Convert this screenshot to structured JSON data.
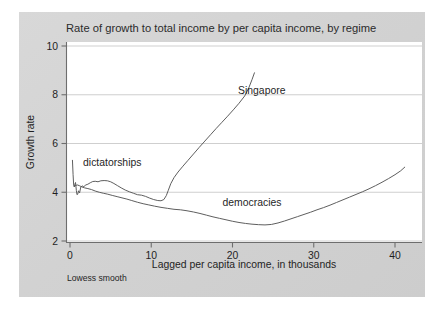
{
  "figure": {
    "panel_bg": "#d4d4d4",
    "plot_bg": "#ffffff",
    "frame_color": "#6e6e6e",
    "grid_color": "#c9c9c9",
    "line_color": "#555555"
  },
  "chart_data": {
    "type": "line",
    "title": "Rate of growth to total income by per capita income, by regime",
    "xlabel": "Lagged per capita income, in thousands",
    "ylabel": "Growth rate",
    "note": "Lowess smooth",
    "grid": "horizontal",
    "legend_position": "inline-annotations",
    "xlim": [
      -0.6,
      43.5
    ],
    "ylim": [
      1.78,
      10.25
    ],
    "xticks": [
      0,
      10,
      20,
      30,
      40
    ],
    "yticks": [
      2,
      4,
      6,
      8,
      10
    ],
    "xtick_labels": [
      "0",
      "10",
      "20",
      "30",
      "40"
    ],
    "ytick_labels": [
      "2",
      "4",
      "6",
      "8",
      "10"
    ],
    "annotations": [
      {
        "text": "Singapore",
        "x": 23.6,
        "y": 8.05
      },
      {
        "text": "dictatorships",
        "x": 5.2,
        "y": 5.08
      },
      {
        "text": "democracies",
        "x": 22.4,
        "y": 3.45
      }
    ],
    "series": [
      {
        "name": "dictatorships",
        "label": "dictatorships",
        "annotation_also": "Singapore",
        "points": [
          [
            0.3,
            5.31
          ],
          [
            0.38,
            4.72
          ],
          [
            0.45,
            4.3
          ],
          [
            0.52,
            4.22
          ],
          [
            0.6,
            4.33
          ],
          [
            0.68,
            4.4
          ],
          [
            0.78,
            4.08
          ],
          [
            0.86,
            3.9
          ],
          [
            0.95,
            3.92
          ],
          [
            1.05,
            4.06
          ],
          [
            1.18,
            3.97
          ],
          [
            1.32,
            4.21
          ],
          [
            1.5,
            4.26
          ],
          [
            1.7,
            4.23
          ],
          [
            1.95,
            4.3
          ],
          [
            2.2,
            4.33
          ],
          [
            2.5,
            4.39
          ],
          [
            2.8,
            4.44
          ],
          [
            3.1,
            4.45
          ],
          [
            3.45,
            4.43
          ],
          [
            3.8,
            4.47
          ],
          [
            4.2,
            4.48
          ],
          [
            4.6,
            4.47
          ],
          [
            5.0,
            4.43
          ],
          [
            5.4,
            4.36
          ],
          [
            5.85,
            4.27
          ],
          [
            6.3,
            4.18
          ],
          [
            6.8,
            4.09
          ],
          [
            7.3,
            4.02
          ],
          [
            7.8,
            3.96
          ],
          [
            8.3,
            3.9
          ],
          [
            8.8,
            3.88
          ],
          [
            9.3,
            3.83
          ],
          [
            9.8,
            3.76
          ],
          [
            10.3,
            3.7
          ],
          [
            10.8,
            3.66
          ],
          [
            11.2,
            3.65
          ],
          [
            11.55,
            3.7
          ],
          [
            11.85,
            3.86
          ],
          [
            12.1,
            4.08
          ],
          [
            12.4,
            4.35
          ],
          [
            12.8,
            4.6
          ],
          [
            13.3,
            4.83
          ],
          [
            13.9,
            5.07
          ],
          [
            14.5,
            5.3
          ],
          [
            15.2,
            5.57
          ],
          [
            15.9,
            5.84
          ],
          [
            16.6,
            6.1
          ],
          [
            17.3,
            6.36
          ],
          [
            18.0,
            6.62
          ],
          [
            18.7,
            6.87
          ],
          [
            19.4,
            7.12
          ],
          [
            20.1,
            7.38
          ],
          [
            20.8,
            7.65
          ],
          [
            21.5,
            7.95
          ],
          [
            22.0,
            8.28
          ],
          [
            22.4,
            8.62
          ],
          [
            22.7,
            8.9
          ]
        ]
      },
      {
        "name": "democracies",
        "label": "democracies",
        "points": [
          [
            0.55,
            4.24
          ],
          [
            0.7,
            4.28
          ],
          [
            0.9,
            4.3
          ],
          [
            1.15,
            4.27
          ],
          [
            1.45,
            4.22
          ],
          [
            1.8,
            4.18
          ],
          [
            2.2,
            4.15
          ],
          [
            2.65,
            4.11
          ],
          [
            3.1,
            4.05
          ],
          [
            3.6,
            4.0
          ],
          [
            4.1,
            3.96
          ],
          [
            4.65,
            3.92
          ],
          [
            5.2,
            3.87
          ],
          [
            5.8,
            3.82
          ],
          [
            6.4,
            3.77
          ],
          [
            7.0,
            3.72
          ],
          [
            7.6,
            3.66
          ],
          [
            8.3,
            3.59
          ],
          [
            9.0,
            3.53
          ],
          [
            9.7,
            3.48
          ],
          [
            10.4,
            3.43
          ],
          [
            11.2,
            3.38
          ],
          [
            12.0,
            3.34
          ],
          [
            12.8,
            3.3
          ],
          [
            13.6,
            3.28
          ],
          [
            14.4,
            3.24
          ],
          [
            15.2,
            3.19
          ],
          [
            16.0,
            3.13
          ],
          [
            16.8,
            3.06
          ],
          [
            17.6,
            2.99
          ],
          [
            18.4,
            2.93
          ],
          [
            19.2,
            2.87
          ],
          [
            20.0,
            2.81
          ],
          [
            20.8,
            2.76
          ],
          [
            21.6,
            2.72
          ],
          [
            22.4,
            2.69
          ],
          [
            23.2,
            2.67
          ],
          [
            24.0,
            2.66
          ],
          [
            24.8,
            2.68
          ],
          [
            25.6,
            2.74
          ],
          [
            26.4,
            2.82
          ],
          [
            27.2,
            2.91
          ],
          [
            28.0,
            3.0
          ],
          [
            28.8,
            3.09
          ],
          [
            29.6,
            3.18
          ],
          [
            30.4,
            3.28
          ],
          [
            31.2,
            3.37
          ],
          [
            32.0,
            3.47
          ],
          [
            32.8,
            3.58
          ],
          [
            33.6,
            3.69
          ],
          [
            34.4,
            3.8
          ],
          [
            35.2,
            3.91
          ],
          [
            36.0,
            4.02
          ],
          [
            36.8,
            4.14
          ],
          [
            37.6,
            4.27
          ],
          [
            38.4,
            4.41
          ],
          [
            39.2,
            4.56
          ],
          [
            40.0,
            4.72
          ],
          [
            40.7,
            4.88
          ],
          [
            41.2,
            5.03
          ]
        ]
      }
    ]
  }
}
